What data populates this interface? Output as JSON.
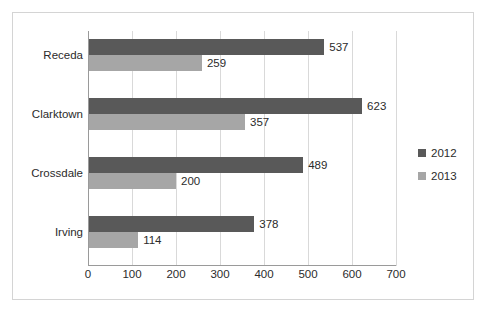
{
  "chart_data": {
    "type": "bar",
    "orientation": "horizontal",
    "title": "",
    "xlabel": "",
    "ylabel": "",
    "categories": [
      "Receda",
      "Clarktown",
      "Crossdale",
      "Irving"
    ],
    "series": [
      {
        "name": "2012",
        "color": "#595959",
        "values": [
          537,
          623,
          489,
          378
        ]
      },
      {
        "name": "2013",
        "color": "#a6a6a6",
        "values": [
          259,
          357,
          200,
          114
        ]
      }
    ],
    "xlim": [
      0,
      700
    ],
    "xticks": [
      0,
      100,
      200,
      300,
      400,
      500,
      600,
      700
    ],
    "xtick_labels": [
      "0",
      "100",
      "200",
      "300",
      "400",
      "500",
      "600",
      "700"
    ],
    "grid": true,
    "grid_axis": "x",
    "legend_position": "right",
    "data_labels": [
      [
        "537",
        "259"
      ],
      [
        "623",
        "357"
      ],
      [
        "489",
        "200"
      ],
      [
        "378",
        "114"
      ]
    ]
  }
}
